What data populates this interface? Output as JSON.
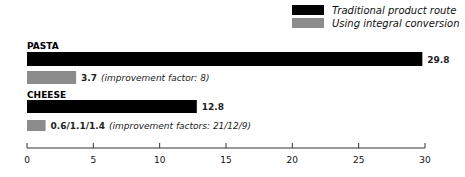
{
  "chart_data": {
    "type": "bar",
    "orientation": "horizontal",
    "title": "",
    "xlabel": "",
    "ylabel": "",
    "xlim": [
      0,
      30
    ],
    "xticks": [
      0,
      5,
      10,
      15,
      20,
      25,
      30
    ],
    "grid": false,
    "legend_position": "top-right",
    "colors": {
      "Traditional product route": "#000000",
      "Using integral conversion": "#8c8c8c"
    },
    "categories": [
      "PASTA",
      "CHEESE"
    ],
    "series": [
      {
        "name": "Traditional product route",
        "values": [
          29.8,
          12.8
        ],
        "labels": [
          "29.8",
          "12.8"
        ],
        "notes": [
          "",
          ""
        ]
      },
      {
        "name": "Using integral conversion",
        "values": [
          3.7,
          1.4
        ],
        "labels": [
          "3.7",
          "0.6/1.1/1.4"
        ],
        "notes": [
          "(improvement factor: 8)",
          "(improvement factors: 21/12/9)"
        ]
      }
    ]
  }
}
